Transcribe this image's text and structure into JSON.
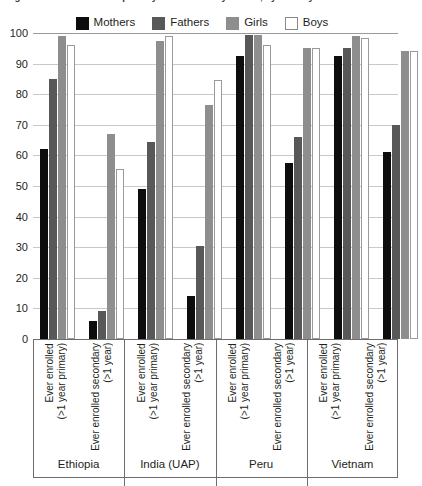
{
  "title": "Figure 4. Ever enrolled in primary and secondary school, by country",
  "legend": {
    "position": "top-center",
    "items": [
      {
        "label": "Mothers",
        "color": "#0d0d0d",
        "swatch": "filled-black"
      },
      {
        "label": "Fathers",
        "color": "#585858",
        "swatch": "filled-dark-gray"
      },
      {
        "label": "Girls",
        "color": "#8e8e8e",
        "swatch": "filled-mid-gray"
      },
      {
        "label": "Boys",
        "color": "#ffffff",
        "swatch": "outlined-white"
      }
    ]
  },
  "axes": {
    "y_ticks": [
      "100",
      "90",
      "80",
      "70",
      "60",
      "50",
      "40",
      "30",
      "20",
      "10",
      "0"
    ],
    "ylabel": "",
    "xlabel": ""
  },
  "categories_text": {
    "primary": "Ever enrolled\n(>1 year primary)",
    "secondary": "Ever enrolled secondary\n(>1 year)"
  },
  "countries": [
    "Ethiopia",
    "India (UAP)",
    "Peru",
    "Vietnam"
  ],
  "chart_data": {
    "type": "bar",
    "title": "Figure 4. Ever enrolled in primary and secondary school, by country",
    "xlabel": "",
    "ylabel": "",
    "ylim": [
      0,
      100
    ],
    "ytick_step": 10,
    "grid": true,
    "legend_position": "top-center",
    "categories": [
      "Ethiopia / Ever enrolled (>1 year primary)",
      "Ethiopia / Ever enrolled secondary (>1 year)",
      "India (UAP) / Ever enrolled (>1 year primary)",
      "India (UAP) / Ever enrolled secondary (>1 year)",
      "Peru / Ever enrolled (>1 year primary)",
      "Peru / Ever enrolled secondary (>1 year)",
      "Vietnam / Ever enrolled (>1 year primary)",
      "Vietnam / Ever enrolled secondary (>1 year)"
    ],
    "series": [
      {
        "name": "Mothers",
        "color": "#0d0d0d",
        "values": [
          62,
          6,
          49,
          14,
          92.5,
          57.5,
          92.5,
          61
        ]
      },
      {
        "name": "Fathers",
        "color": "#585858",
        "values": [
          85,
          9,
          64.5,
          30.5,
          99.5,
          66,
          95,
          70
        ]
      },
      {
        "name": "Girls",
        "color": "#8e8e8e",
        "values": [
          99,
          67,
          97.5,
          76.5,
          99.5,
          95,
          99,
          94
        ]
      },
      {
        "name": "Boys",
        "color": "#ffffff",
        "values": [
          96,
          55.5,
          99,
          84.5,
          96,
          95,
          98.5,
          94
        ]
      }
    ],
    "groups": [
      {
        "country": "Ethiopia",
        "bars": [
          {
            "category": "Ever enrolled (>1 year primary)",
            "Mothers": 62,
            "Fathers": 85,
            "Girls": 99,
            "Boys": 96
          },
          {
            "category": "Ever enrolled secondary (>1 year)",
            "Mothers": 6,
            "Fathers": 9,
            "Girls": 67,
            "Boys": 55.5
          }
        ]
      },
      {
        "country": "India (UAP)",
        "bars": [
          {
            "category": "Ever enrolled (>1 year primary)",
            "Mothers": 49,
            "Fathers": 64.5,
            "Girls": 97.5,
            "Boys": 99
          },
          {
            "category": "Ever enrolled secondary (>1 year)",
            "Mothers": 14,
            "Fathers": 30.5,
            "Girls": 76.5,
            "Boys": 84.5
          }
        ]
      },
      {
        "country": "Peru",
        "bars": [
          {
            "category": "Ever enrolled (>1 year primary)",
            "Mothers": 92.5,
            "Fathers": 99.5,
            "Girls": 99.5,
            "Boys": 96
          },
          {
            "category": "Ever enrolled secondary (>1 year)",
            "Mothers": 57.5,
            "Fathers": 66,
            "Girls": 95,
            "Boys": 95
          }
        ]
      },
      {
        "country": "Vietnam",
        "bars": [
          {
            "category": "Ever enrolled (>1 year primary)",
            "Mothers": 92.5,
            "Fathers": 95,
            "Girls": 99,
            "Boys": 98.5
          },
          {
            "category": "Ever enrolled secondary (>1 year)",
            "Mothers": 61,
            "Fathers": 70,
            "Girls": 94,
            "Boys": 94
          }
        ]
      }
    ]
  }
}
